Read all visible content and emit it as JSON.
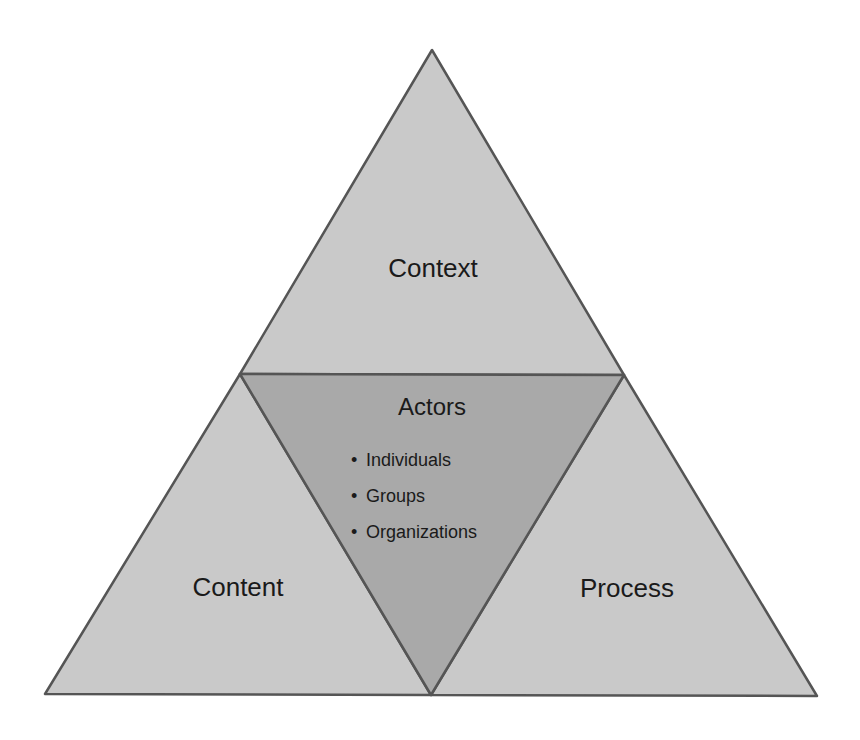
{
  "diagram": {
    "colors": {
      "outer_fill": "#c9c9c9",
      "center_fill": "#a9a9a9",
      "stroke": "#555555",
      "text": "#1a1a1a"
    },
    "regions": {
      "top": {
        "label": "Context"
      },
      "left": {
        "label": "Content"
      },
      "right": {
        "label": "Process"
      },
      "center": {
        "title": "Actors",
        "items": [
          "Individuals",
          "Groups",
          "Organizations"
        ],
        "bullet": "•"
      }
    }
  }
}
